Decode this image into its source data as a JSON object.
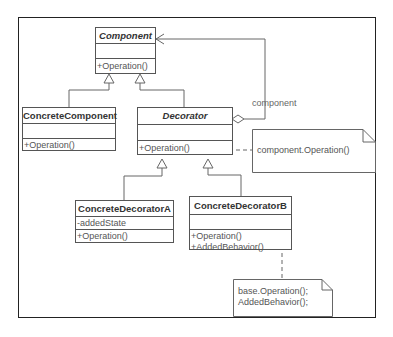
{
  "diagram": {
    "type": "UML class diagram",
    "pattern": "Decorator",
    "classes": {
      "component": {
        "name": "Component",
        "abstract": true,
        "attributes": [],
        "operations": [
          "+Operation()"
        ]
      },
      "concrete_component": {
        "name": "ConcreteComponent",
        "abstract": false,
        "attributes": [],
        "operations": [
          "+Operation()"
        ]
      },
      "decorator": {
        "name": "Decorator",
        "abstract": true,
        "attributes": [],
        "operations": [
          "+Operation()"
        ]
      },
      "concrete_decorator_a": {
        "name": "ConcreteDecoratorA",
        "abstract": false,
        "attributes": [
          "-addedState"
        ],
        "operations": [
          "+Operation()"
        ]
      },
      "concrete_decorator_b": {
        "name": "ConcreteDecoratorB",
        "abstract": false,
        "attributes": [],
        "operations": [
          "+Operation()",
          "+AddedBehavior()"
        ]
      }
    },
    "notes": {
      "decorator_note": {
        "lines": [
          "component.Operation()"
        ]
      },
      "decorator_b_note": {
        "lines": [
          "base.Operation();",
          "AddedBehavior();"
        ]
      }
    },
    "associations": {
      "aggregation_label": "component"
    },
    "relationships": [
      {
        "type": "generalization",
        "from": "ConcreteComponent",
        "to": "Component"
      },
      {
        "type": "generalization",
        "from": "Decorator",
        "to": "Component"
      },
      {
        "type": "aggregation",
        "from": "Decorator",
        "to": "Component",
        "label": "component"
      },
      {
        "type": "generalization",
        "from": "ConcreteDecoratorA",
        "to": "Decorator"
      },
      {
        "type": "generalization",
        "from": "ConcreteDecoratorB",
        "to": "Decorator"
      },
      {
        "type": "note-anchor",
        "from": "Decorator.Operation()",
        "to": "decorator_note"
      },
      {
        "type": "note-anchor",
        "from": "ConcreteDecoratorB",
        "to": "decorator_b_note"
      }
    ],
    "colors": {
      "line": "#555555",
      "frame": "#222222",
      "text": "#333333"
    }
  }
}
